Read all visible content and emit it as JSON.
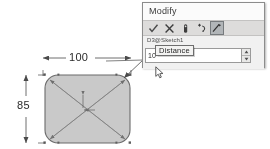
{
  "drawing": {
    "width_dimension": "100",
    "height_dimension": "85",
    "shape_name": "rounded-rectangle-sketch",
    "shape_fill": "#c9c9c9",
    "shape_stroke": "#6b6b6b",
    "dimension_line_color": "#4a4a4a",
    "construction_line_color": "#7d7d7d"
  },
  "dialog": {
    "title": "Modify",
    "param_label": "D3@Sketch1",
    "tooltip": "Distance",
    "value": "10",
    "value_placeholder": "10",
    "toolbar": {
      "accept_label": "✓",
      "cancel_label": "✕",
      "items": [
        {
          "icon": "checkmark-icon",
          "label": "✓",
          "active": false
        },
        {
          "icon": "cancel-x-icon",
          "label": "✕",
          "active": false
        },
        {
          "icon": "rebuild-icon",
          "label": "",
          "active": false
        },
        {
          "icon": "reverse-direction-icon",
          "label": "",
          "active": false
        },
        {
          "icon": "mark-for-drawing-icon",
          "label": "",
          "active": true
        }
      ]
    },
    "spinner": {
      "up_label": "▲",
      "down_label": "▼"
    },
    "accent_color": "#a9b6c4",
    "titlebar_color": "#fbfbfa",
    "toolbar_color": "#dedcd8",
    "body_color": "#f2f1ef",
    "border_color": "#8c8c8c"
  },
  "cursor": {
    "name": "arrow-pointer"
  }
}
